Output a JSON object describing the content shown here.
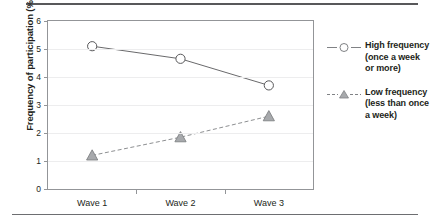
{
  "chart_data": {
    "type": "line",
    "title": "",
    "xlabel": "",
    "ylabel": "Frequency of participation (%)",
    "categories": [
      "Wave 1",
      "Wave 2",
      "Wave 3"
    ],
    "ylim": [
      0,
      6
    ],
    "ytick_labels": [
      "0",
      "1",
      "2",
      "3",
      "4",
      "5",
      "6"
    ],
    "ytick_values": [
      0,
      1,
      2,
      3,
      4,
      5,
      6
    ],
    "grid": true,
    "legend_position": "right",
    "series": [
      {
        "name": "High frequency (once a week or more)",
        "legend_lines": [
          "High frequency",
          "(once a week",
          "or more)"
        ],
        "marker": "open-circle",
        "line_style": "solid",
        "color": "#58585a",
        "values": [
          5.1,
          4.65,
          3.7
        ]
      },
      {
        "name": "Low frequency (less than once a week)",
        "legend_lines": [
          "Low frequency",
          "(less than once",
          "a week)"
        ],
        "marker": "filled-triangle",
        "line_style": "dashed",
        "color": "#808285",
        "values": [
          1.2,
          1.85,
          2.6
        ]
      }
    ]
  },
  "axes": {
    "y_title": "Frequency of participation (%)",
    "y_ticks": [
      "6",
      "5",
      "4",
      "3",
      "2",
      "1",
      "0"
    ],
    "x_ticks": [
      "Wave 1",
      "Wave 2",
      "Wave 3"
    ]
  },
  "legend": {
    "entries": [
      {
        "lines": [
          "High frequency",
          "(once a week",
          "or more)"
        ],
        "marker": "open-circle-icon"
      },
      {
        "lines": [
          "Low frequency",
          "(less than once",
          "a week)"
        ],
        "marker": "filled-triangle-icon"
      }
    ]
  }
}
